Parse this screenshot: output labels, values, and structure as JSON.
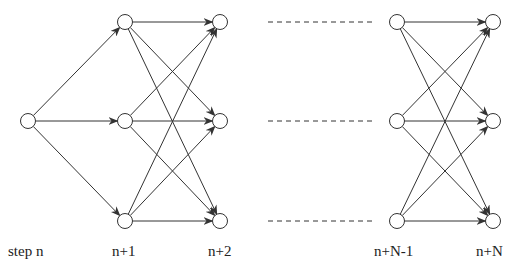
{
  "diagram": {
    "type": "layered-directed-graph",
    "stroke_color": "#333333",
    "node_radius": 7.5,
    "start_node": {
      "x": 28,
      "y": 121
    },
    "columns": [
      {
        "label": "n+1",
        "x": 125
      },
      {
        "label": "n+2",
        "x": 220
      },
      {
        "label": "n+N-1",
        "x": 397
      },
      {
        "label": "n+N",
        "x": 493
      }
    ],
    "rows_y": [
      22,
      121,
      221
    ],
    "dashed_gap": {
      "x1": 268,
      "x2": 372
    },
    "labels": [
      {
        "text": "step n",
        "x": 8,
        "y": 255
      },
      {
        "text": "n+1",
        "x": 112,
        "y": 255
      },
      {
        "text": "n+2",
        "x": 208,
        "y": 255
      },
      {
        "text": "n+N-1",
        "x": 374,
        "y": 255
      },
      {
        "text": "n+N",
        "x": 476,
        "y": 255
      }
    ]
  }
}
